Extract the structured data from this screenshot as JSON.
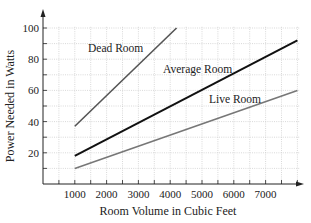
{
  "chart_data": {
    "type": "line",
    "title": "",
    "xlabel": "Room Volume in Cubic Feet",
    "ylabel": "Power Needed in Watts",
    "xlim": [
      0,
      8000
    ],
    "ylim": [
      0,
      100
    ],
    "x_ticks": [
      1000,
      2000,
      3000,
      4000,
      5000,
      6000,
      7000
    ],
    "x_tick_labels": [
      "1000",
      "2000",
      "3000",
      "4000",
      "5000",
      "6000",
      "7000"
    ],
    "y_ticks": [
      20,
      40,
      60,
      80,
      100
    ],
    "y_tick_labels": [
      "20",
      "40",
      "60",
      "80",
      "100"
    ],
    "grid": true,
    "legend": "inline labels",
    "series": [
      {
        "name": "Dead Room",
        "x": [
          1000,
          4200
        ],
        "y": [
          37,
          100
        ],
        "color": "#555555"
      },
      {
        "name": "Average Room",
        "x": [
          1000,
          8000
        ],
        "y": [
          18,
          92
        ],
        "color": "#111111"
      },
      {
        "name": "Live Room",
        "x": [
          1000,
          8000
        ],
        "y": [
          10,
          60
        ],
        "color": "#777777"
      }
    ]
  },
  "labels": {
    "dead": "Dead Room",
    "average": "Average Room",
    "live": "Live Room",
    "xlabel": "Room Volume in Cubic Feet",
    "ylabel": "Power Needed in Watts"
  }
}
